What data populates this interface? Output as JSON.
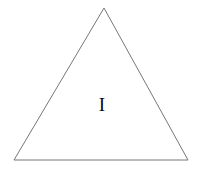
{
  "figure": {
    "name": "triangle-with-region-label",
    "background_color": "#ffffff",
    "width": 201,
    "height": 169
  },
  "shape": {
    "kind": "triangle",
    "label": "triangle-outline",
    "stroke_color": "#77777a",
    "fill_color": "none",
    "stroke_width": 1,
    "points": "104,8 188,160 14,160",
    "vertices": [
      {
        "name": "apex",
        "x": 104,
        "y": 8
      },
      {
        "name": "bottom-right",
        "x": 188,
        "y": 160
      },
      {
        "name": "bottom-left",
        "x": 14,
        "y": 160
      }
    ]
  },
  "labels": [
    {
      "name": "region-label-i",
      "text": "I",
      "x": 102,
      "y": 104,
      "color": "#0a0a0a",
      "font_size": 19
    }
  ]
}
